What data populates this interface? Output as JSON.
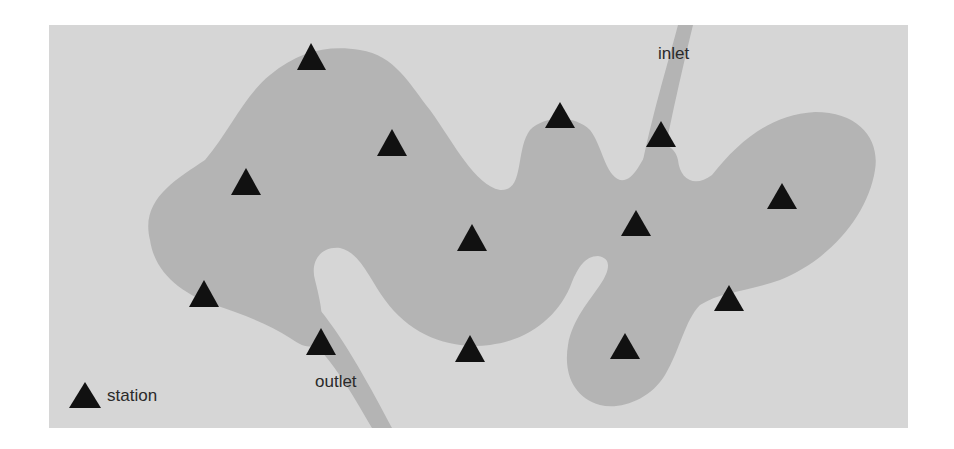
{
  "colors": {
    "page_background": "#ffffff",
    "map_background": "#d6d6d6",
    "lake_fill": "#b4b4b4",
    "river_fill": "#b4b4b4",
    "station_marker": "#111111",
    "label_text": "#2a2a2a"
  },
  "labels": {
    "inlet": "inlet",
    "outlet": "outlet"
  },
  "legend": {
    "station_label": "station",
    "station_icon": "triangle-icon"
  },
  "stations": [
    {
      "x": 311,
      "y": 57
    },
    {
      "x": 392,
      "y": 143
    },
    {
      "x": 245,
      "y": 182
    },
    {
      "x": 472,
      "y": 238
    },
    {
      "x": 204,
      "y": 294
    },
    {
      "x": 321,
      "y": 342
    },
    {
      "x": 470,
      "y": 349
    },
    {
      "x": 560,
      "y": 117
    },
    {
      "x": 661,
      "y": 135
    },
    {
      "x": 636,
      "y": 224
    },
    {
      "x": 782,
      "y": 197
    },
    {
      "x": 729,
      "y": 299
    },
    {
      "x": 625,
      "y": 347
    }
  ]
}
